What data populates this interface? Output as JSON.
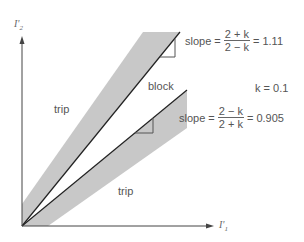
{
  "diagram": {
    "axes": {
      "y_label": "I'",
      "y_label_sub": "2",
      "x_label": "I'",
      "x_label_sub": "1"
    },
    "regions": {
      "trip_upper_left": "trip",
      "block": "block",
      "trip_lower_right": "trip"
    },
    "upper_slope": {
      "prefix": "slope =",
      "numerator": "2 + k",
      "denominator": "2 − k",
      "result": "= 1.11"
    },
    "k_value": "k = 0.1",
    "lower_slope": {
      "prefix": "slope =",
      "numerator": "2 − k",
      "denominator": "2 + k",
      "result": "= 0.905"
    },
    "colors": {
      "band": "#c8c8c8",
      "line": "#222222",
      "axis": "#444444",
      "text": "#555555"
    }
  }
}
